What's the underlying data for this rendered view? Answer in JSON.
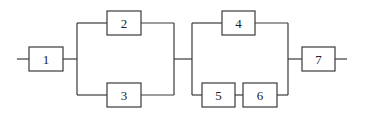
{
  "diagram": {
    "type": "reliability-block-diagram",
    "blocks": [
      {
        "id": "1",
        "label": "1",
        "x": 29,
        "y": 47,
        "w": 34,
        "h": 24
      },
      {
        "id": "2",
        "label": "2",
        "x": 107,
        "y": 11,
        "w": 34,
        "h": 24
      },
      {
        "id": "3",
        "label": "3",
        "x": 107,
        "y": 83,
        "w": 34,
        "h": 24
      },
      {
        "id": "4",
        "label": "4",
        "x": 222,
        "y": 11,
        "w": 33,
        "h": 24
      },
      {
        "id": "5",
        "label": "5",
        "x": 202,
        "y": 83,
        "w": 33,
        "h": 24
      },
      {
        "id": "6",
        "label": "6",
        "x": 243,
        "y": 83,
        "w": 34,
        "h": 24
      },
      {
        "id": "7",
        "label": "7",
        "x": 302,
        "y": 47,
        "w": 33,
        "h": 24
      }
    ],
    "structure": "1 in series with (2 parallel 3) in series with (4 parallel (5 series 6)) in series with 7"
  }
}
